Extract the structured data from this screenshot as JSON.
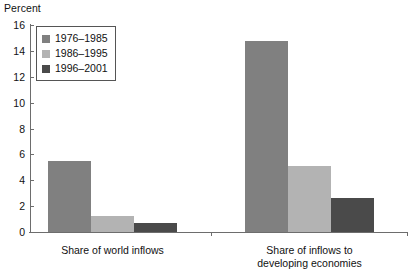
{
  "chart_data": {
    "type": "bar",
    "title": "",
    "subtitle": "",
    "ylabel": "Percent",
    "xlabel": "",
    "ylim": [
      0,
      16
    ],
    "yticks": [
      0,
      2,
      4,
      6,
      8,
      10,
      12,
      14,
      16
    ],
    "ytick_labels": [
      "0",
      "2",
      "4",
      "6",
      "8",
      "10",
      "12",
      "14",
      "16"
    ],
    "grid": false,
    "legend_position": "upper-left",
    "categories": [
      "Share of world inflows",
      "Share of inflows to developing economies"
    ],
    "category_lines": [
      [
        "Share of world inflows"
      ],
      [
        "Share of inflows to",
        "developing economies"
      ]
    ],
    "series": [
      {
        "name": "1976–1985",
        "color": "#808080",
        "values": [
          5.5,
          14.8
        ]
      },
      {
        "name": "1986–1995",
        "color": "#b3b3b3",
        "values": [
          1.2,
          5.1
        ]
      },
      {
        "name": "1996–2001",
        "color": "#4a4a4a",
        "values": [
          0.7,
          2.6
        ]
      }
    ]
  },
  "axis": {
    "y_title": "Percent"
  },
  "legend": {
    "items": [
      {
        "label": "1976–1985",
        "color": "#808080"
      },
      {
        "label": "1986–1995",
        "color": "#b3b3b3"
      },
      {
        "label": "1996–2001",
        "color": "#4a4a4a"
      }
    ]
  },
  "colors": {
    "axis": "#6d6d6d",
    "text": "#111111",
    "background": "#ffffff",
    "legend_border": "#555555"
  }
}
